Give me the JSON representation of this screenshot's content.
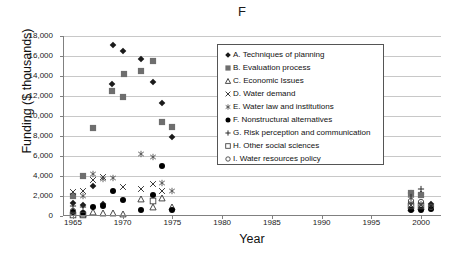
{
  "chart_data": {
    "type": "scatter",
    "title": "F",
    "xlabel": "Year",
    "ylabel": "Funding ($ thousands)",
    "xlim": [
      1964,
      2002
    ],
    "ylim": [
      0,
      18000
    ],
    "xticks": [
      1965,
      1970,
      1975,
      1980,
      1985,
      1990,
      1995,
      2000
    ],
    "xtick_labels": [
      "1965",
      "1970",
      "1975",
      "1980",
      "1985",
      "1990",
      "1995",
      "2000"
    ],
    "yticks": [
      0,
      2000,
      4000,
      6000,
      8000,
      10000,
      12000,
      14000,
      16000,
      18000
    ],
    "ytick_labels": [
      "0",
      "2,000",
      "4,000",
      "6,000",
      "8,000",
      "10,000",
      "12,000",
      "14,000",
      "16,000",
      "18,000"
    ],
    "grid": "horizontal",
    "legend_position": "upper-right-inside",
    "series": [
      {
        "name": "A. Techniques of planning",
        "key": "A",
        "marker": "filled-diamond",
        "color": "#1a1a1a",
        "points": [
          [
            1965,
            1300
          ],
          [
            1966,
            1150
          ],
          [
            1967,
            3050
          ],
          [
            1968,
            1250
          ],
          [
            1968.9,
            13250
          ],
          [
            1969,
            17100
          ],
          [
            1970,
            16500
          ],
          [
            1971.8,
            15750
          ],
          [
            1973,
            13450
          ],
          [
            1974,
            11300
          ],
          [
            1975,
            7950
          ],
          [
            1999,
            2350
          ],
          [
            2000,
            2250
          ],
          [
            2001,
            1250
          ]
        ]
      },
      {
        "name": "B. Evaluation process",
        "key": "B",
        "marker": "filled-square",
        "color": "#6e6e6e",
        "points": [
          [
            1965,
            2050
          ],
          [
            1966,
            4050
          ],
          [
            1967,
            8800
          ],
          [
            1968.9,
            12500
          ],
          [
            1970,
            11900
          ],
          [
            1970.1,
            14200
          ],
          [
            1971.8,
            14500
          ],
          [
            1973,
            15500
          ],
          [
            1974,
            9450
          ],
          [
            1975,
            8900
          ],
          [
            1999,
            2300
          ],
          [
            2000,
            2150
          ]
        ]
      },
      {
        "name": "C. Economic Issues",
        "key": "C",
        "marker": "open-triangle",
        "color": "#333333",
        "points": [
          [
            1966,
            250
          ],
          [
            1967,
            400
          ],
          [
            1968,
            350
          ],
          [
            1969,
            300
          ],
          [
            1970,
            200
          ],
          [
            1971.8,
            1700
          ],
          [
            1973,
            950
          ],
          [
            1974,
            1800
          ],
          [
            1975,
            950
          ],
          [
            1999,
            800
          ],
          [
            2000,
            900
          ]
        ]
      },
      {
        "name": "D. Water demand",
        "key": "D",
        "marker": "x-cross",
        "color": "#3a3a3a",
        "points": [
          [
            1965,
            2400
          ],
          [
            1966,
            2550
          ],
          [
            1967,
            3600
          ],
          [
            1968,
            3900
          ],
          [
            1970,
            2900
          ],
          [
            1971.8,
            2750
          ],
          [
            1973,
            3200
          ],
          [
            1974,
            2550
          ],
          [
            1999,
            1150
          ],
          [
            2000,
            1100
          ]
        ]
      },
      {
        "name": "E. Water law and institutions",
        "key": "E",
        "marker": "asterisk",
        "color": "#505050",
        "points": [
          [
            1966,
            2050
          ],
          [
            1967,
            4200
          ],
          [
            1968,
            3700
          ],
          [
            1969,
            3800
          ],
          [
            1971.8,
            6200
          ],
          [
            1973,
            5950
          ],
          [
            1974,
            3350
          ],
          [
            1975,
            2500
          ],
          [
            1999,
            1350
          ],
          [
            2000,
            1250
          ]
        ]
      },
      {
        "name": "F. Nonstructural alternatives",
        "key": "F",
        "marker": "filled-circle",
        "color": "#000000",
        "points": [
          [
            1965,
            400
          ],
          [
            1966,
            350
          ],
          [
            1967,
            950
          ],
          [
            1968,
            1050
          ],
          [
            1969,
            2550
          ],
          [
            1970,
            1650
          ],
          [
            1971.8,
            600
          ],
          [
            1973,
            2150
          ],
          [
            1974,
            5000
          ],
          [
            1975,
            600
          ],
          [
            1999,
            600
          ],
          [
            2000,
            650
          ],
          [
            2001,
            700
          ]
        ]
      },
      {
        "name": "G. Risk perception and communication",
        "key": "G",
        "marker": "plus",
        "color": "#2a2a2a",
        "points": [
          [
            1965,
            1000
          ],
          [
            1966,
            900
          ],
          [
            1999,
            1900
          ],
          [
            2000,
            2700
          ],
          [
            2001,
            1000
          ]
        ]
      },
      {
        "name": "H. Other social sciences",
        "key": "H",
        "marker": "open-square",
        "color": "#444444",
        "points": [
          [
            1965,
            150
          ],
          [
            1966,
            100
          ],
          [
            1973,
            1550
          ],
          [
            1999,
            1000
          ],
          [
            2000,
            1050
          ]
        ]
      },
      {
        "name": "I. Water resources policy",
        "key": "I",
        "marker": "open-circle",
        "color": "#444444",
        "points": [
          [
            1965,
            500
          ],
          [
            1999,
            1500
          ],
          [
            2000,
            1450
          ],
          [
            2001,
            900
          ]
        ]
      }
    ]
  },
  "legend": {
    "items": [
      {
        "marker": "filled-diamond",
        "label": "A. Techniques of planning"
      },
      {
        "marker": "filled-square",
        "label": "B. Evaluation process"
      },
      {
        "marker": "open-triangle",
        "label": "C. Economic Issues"
      },
      {
        "marker": "x-cross",
        "label": "D. Water demand"
      },
      {
        "marker": "asterisk",
        "label": "E. Water law and institutions"
      },
      {
        "marker": "filled-circle",
        "label": "F. Nonstructural alternatives"
      },
      {
        "marker": "plus",
        "label": "G. Risk perception and communication"
      },
      {
        "marker": "open-square",
        "label": "H. Other social sciences"
      },
      {
        "marker": "open-circle",
        "label": "I. Water resources policy"
      }
    ]
  },
  "colors": {
    "gridline": "#c8c8c8",
    "axis": "#808080",
    "text": "#111111",
    "legend_border": "#555555",
    "background": "#ffffff"
  }
}
